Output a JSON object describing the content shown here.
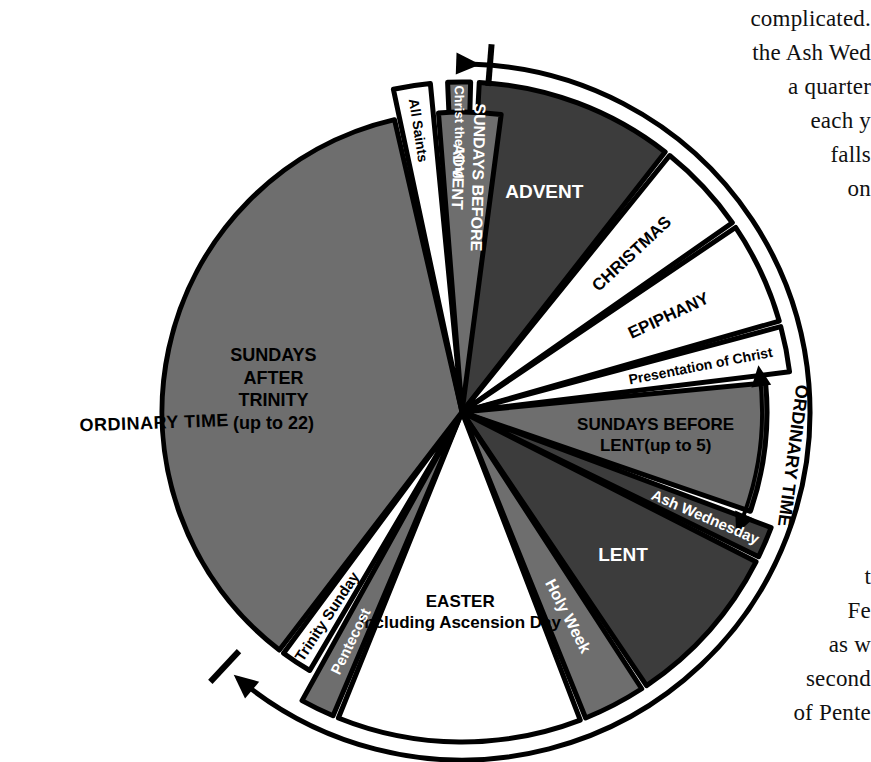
{
  "figure": {
    "kind": "liturgical-year-wheel",
    "center": {
      "x": 462,
      "y": 412
    },
    "colors": {
      "dark": "#3c3c3c",
      "mid": "#6e6e6e",
      "white": "#ffffff",
      "stroke": "#000000",
      "text_dark": "#000000",
      "text_light": "#ffffff"
    }
  },
  "outer_arc": {
    "label": "ORDINARY TIME",
    "start_arrowhead": "arrow-right",
    "end_arrowhead": "arrow-down-left",
    "radius": 348
  },
  "side_bracket": {
    "label": "ORDINARY TIME",
    "arrowheads": "double"
  },
  "sectors": [
    {
      "name": "christ-the-king",
      "label": "Christ the King",
      "fill": "mid",
      "text_color": "#ffffff",
      "a0": -92.5,
      "a1": -88.5,
      "r": 330,
      "label_radius": 280,
      "label_size": 13,
      "orientation": "radial"
    },
    {
      "name": "advent",
      "label": "ADVENT",
      "fill": "dark",
      "text_color": "#ffffff",
      "a0": -87.0,
      "a1": -52.0,
      "r": 330,
      "label_radius": 235,
      "label_size": 19,
      "orientation": "horizontal"
    },
    {
      "name": "christmas",
      "label": "CHRISTMAS",
      "fill": "white",
      "text_color": "#000000",
      "a0": -51.0,
      "a1": -35.0,
      "r": 330,
      "label_radius": 232,
      "label_size": 17,
      "orientation": "radial"
    },
    {
      "name": "epiphany",
      "label": "EPIPHANY",
      "fill": "white",
      "text_color": "#000000",
      "a0": -34.0,
      "a1": -16.0,
      "r": 330,
      "label_radius": 228,
      "label_size": 17,
      "orientation": "radial"
    },
    {
      "name": "presentation-of-christ",
      "label": "Presentation of Christ",
      "fill": "white",
      "text_color": "#000000",
      "a0": -15.0,
      "a1": -7.0,
      "r": 330,
      "label_radius": 243,
      "label_size": 14,
      "orientation": "radial"
    },
    {
      "name": "sundays-before-lent",
      "label": "SUNDAYS BEFORE\nLENT(up to 5)",
      "fill": "mid",
      "text_color": "#000000",
      "a0": -5.5,
      "a1": 19.0,
      "r": 305,
      "label_radius": 195,
      "label_size": 17,
      "orientation": "horizontal"
    },
    {
      "name": "ash-wednesday",
      "label": "Ash Wednesday",
      "fill": "dark",
      "text_color": "#ffffff",
      "a0": 20.5,
      "a1": 26.0,
      "r": 330,
      "label_radius": 265,
      "label_size": 15,
      "orientation": "radial"
    },
    {
      "name": "lent",
      "label": "LENT",
      "fill": "dark",
      "text_color": "#ffffff",
      "a0": 27.0,
      "a1": 56.0,
      "r": 330,
      "label_radius": 215,
      "label_size": 19,
      "orientation": "horizontal"
    },
    {
      "name": "holy-week",
      "label": "Holy Week",
      "fill": "mid",
      "text_color": "#ffffff",
      "a0": 57.0,
      "a1": 68.0,
      "r": 330,
      "label_radius": 230,
      "label_size": 16,
      "orientation": "radial"
    },
    {
      "name": "easter",
      "label": "EASTER\nIncluding Ascension Day",
      "fill": "white",
      "text_color": "#000000",
      "a0": 69.0,
      "a1": 112.0,
      "r": 330,
      "label_radius": 200,
      "label_size": 17,
      "orientation": "horizontal"
    },
    {
      "name": "pentecost",
      "label": "Pentecost",
      "fill": "mid",
      "text_color": "#ffffff",
      "a0": 113.0,
      "a1": 119.0,
      "r": 330,
      "label_radius": 255,
      "label_size": 15,
      "orientation": "radial"
    },
    {
      "name": "trinity-sunday",
      "label": "Trinity Sunday",
      "fill": "white",
      "text_color": "#000000",
      "a0": 120.5,
      "a1": 126.5,
      "r": 300,
      "label_radius": 245,
      "label_size": 15,
      "orientation": "radial"
    },
    {
      "name": "sundays-after-trinity",
      "label": "SUNDAYS\nAFTER\nTRINITY\n(up to 22)",
      "fill": "mid",
      "text_color": "#000000",
      "a0": 127.5,
      "a1": 257.0,
      "r": 300,
      "label_radius": 190,
      "label_size": 18,
      "orientation": "horizontal",
      "label_angle": 187
    },
    {
      "name": "all-saints",
      "label": "All Saints",
      "fill": "white",
      "text_color": "#000000",
      "a0": 258.0,
      "a1": 264.5,
      "r": 330,
      "label_radius": 285,
      "label_size": 14,
      "orientation": "radial"
    },
    {
      "name": "sundays-before-advent",
      "label": "SUNDAYS BEFORE\nADVENT",
      "fill": "mid",
      "text_color": "#ffffff",
      "a0": 265.5,
      "a1": 277.5,
      "r": 300,
      "label_radius": 235,
      "label_size": 16,
      "orientation": "radial"
    }
  ],
  "page_text": {
    "top_paragraph": [
      "complicated.",
      "the Ash Wed",
      "a quarter",
      "each y",
      "falls",
      "on"
    ],
    "bottom_paragraph": [
      "t",
      "Fe",
      "as w",
      "second",
      "of Pente"
    ]
  }
}
